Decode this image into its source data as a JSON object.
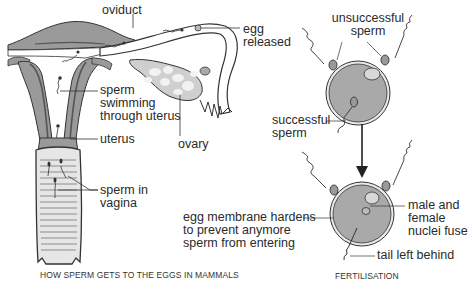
{
  "left_panel": {
    "caption": "HOW SPERM GETS TO THE EGGS IN MAMMALS",
    "labels": {
      "oviduct": "oviduct",
      "egg_released_1": "egg",
      "egg_released_2": "released",
      "sperm_uterus_1": "sperm",
      "sperm_uterus_2": "swimming",
      "sperm_uterus_3": "through uterus",
      "uterus": "uterus",
      "ovary": "ovary",
      "sperm_vagina_1": "sperm in",
      "sperm_vagina_2": "vagina"
    }
  },
  "right_panel": {
    "caption": "FERTILISATION",
    "labels": {
      "unsuccessful_1": "unsuccessful",
      "unsuccessful_2": "sperm",
      "successful_1": "successful",
      "successful_2": "sperm",
      "membrane_1": "egg membrane hardens",
      "membrane_2": "to prevent anymore",
      "membrane_3": "sperm from entering",
      "nuclei_1": "male and",
      "nuclei_2": "female",
      "nuclei_3": "nuclei fuse",
      "tail": "tail left behind"
    }
  },
  "colors": {
    "tissue": "#9a9a9a",
    "tissue_dark": "#6e6e6e",
    "egg_fill": "#a9a9a9",
    "ovary_fill": "#cfcfcf",
    "outline": "#333333"
  }
}
